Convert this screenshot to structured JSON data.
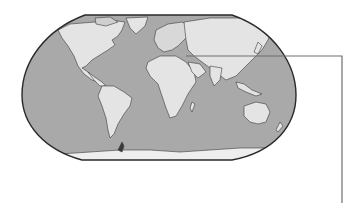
{
  "figure": {
    "type": "world-map-illustration",
    "projection_shape": "robinson-like rounded rectangle",
    "colors": {
      "ocean": "#a9a9a9",
      "land": "#e6e6e6",
      "land_shade": "#cfcfcf",
      "outline": "#2a2a2a",
      "leader_line": "#6e6e6e",
      "background": "#ffffff"
    },
    "callout": {
      "description": "leader line from the Mediterranean / Middle East region out to the right margin",
      "start": [
        186,
        56
      ],
      "corner": [
        342,
        56
      ],
      "end": [
        342,
        203
      ]
    }
  }
}
